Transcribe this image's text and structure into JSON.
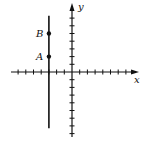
{
  "diagram": {
    "type": "coordinate-plane",
    "axes": {
      "x_label": "x",
      "y_label": "y",
      "origin_px": [
        72,
        72
      ],
      "unit_px": 7.7,
      "x_range": [
        -8,
        8
      ],
      "y_range": [
        -8,
        8
      ]
    },
    "vertical_line": {
      "x": -3,
      "y_from": -7.3,
      "y_to": 7.3
    },
    "points": [
      {
        "label": "B",
        "x": -3,
        "y": 5
      },
      {
        "label": "A",
        "x": -3,
        "y": 2
      }
    ],
    "colors": {
      "ink": "#111111",
      "background": "#ffffff"
    }
  }
}
